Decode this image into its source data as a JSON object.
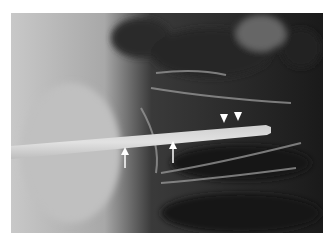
{
  "figure": {
    "type": "radiograph",
    "annotations": [
      {
        "kind": "arrow",
        "direction": "up",
        "target": "lower edge of needle"
      },
      {
        "kind": "arrow",
        "direction": "up",
        "target": "lower edge of needle"
      },
      {
        "kind": "arrowhead",
        "direction": "down",
        "target": "upper edge of needle"
      },
      {
        "kind": "arrowhead",
        "direction": "down",
        "target": "upper edge of needle"
      }
    ],
    "colors": {
      "background": "#ffffff",
      "annotation": "#ffffff"
    }
  }
}
